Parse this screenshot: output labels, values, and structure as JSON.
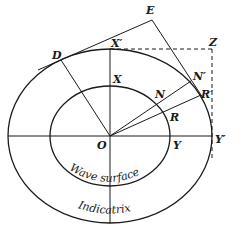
{
  "figure": {
    "labels": {
      "E": "E",
      "D": "D",
      "X_prime": "X′",
      "Z": "Z",
      "X": "X",
      "N_prime": "N′",
      "N": "N",
      "R_prime": "R′",
      "R": "R",
      "O": "O",
      "Y": "Y",
      "Y_prime": "Y′"
    },
    "captions": {
      "inner": "Wave surface",
      "outer": "Indicatrix"
    }
  }
}
